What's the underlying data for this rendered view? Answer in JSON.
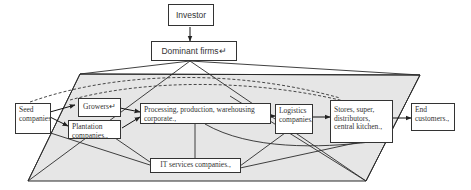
{
  "diagram": {
    "colors": {
      "stroke": "#2b2b2b",
      "plane_fill": "#e6e6e6",
      "box_fill": "#ffffff",
      "text": "#333333"
    },
    "nodes": {
      "investor": "Investor",
      "dominant_firms": "Dominant firms↵",
      "seed_companies": "Seed companies.,",
      "growers": "Growers↵",
      "plantation_companies": "Plantation companies.,",
      "processing": "Processing, production, warehousing corporate.,",
      "logistics": "Logistics companies.,",
      "stores": "Stores, super, distributors, central kitchen.,",
      "end_customers": "End customers.,",
      "it_services": "IT services companies.,"
    },
    "edges": [
      {
        "from": "investor",
        "to": "dominant_firms",
        "style": "arrow"
      },
      {
        "from": "seed_companies",
        "to": "growers",
        "style": "arrow"
      },
      {
        "from": "seed_companies",
        "to": "plantation_companies",
        "style": "arrow"
      },
      {
        "from": "growers",
        "to": "processing",
        "style": "arrow"
      },
      {
        "from": "plantation_companies",
        "to": "processing",
        "style": "arrow"
      },
      {
        "from": "processing",
        "to": "logistics",
        "style": "arrow"
      },
      {
        "from": "logistics",
        "to": "stores",
        "style": "arrow"
      },
      {
        "from": "stores",
        "to": "end_customers",
        "style": "arrow"
      },
      {
        "from": "seed_companies",
        "to": "stores",
        "style": "dashed"
      },
      {
        "from": "growers",
        "to": "stores",
        "style": "dashed"
      },
      {
        "from": "seed_companies",
        "to": "it_services",
        "style": "line"
      },
      {
        "from": "plantation_companies",
        "to": "it_services",
        "style": "line"
      },
      {
        "from": "processing",
        "to": "it_services",
        "style": "line"
      },
      {
        "from": "logistics",
        "to": "it_services",
        "style": "line"
      },
      {
        "from": "stores",
        "to": "it_services",
        "style": "line"
      },
      {
        "from": "processing",
        "to": "stores",
        "style": "curve"
      },
      {
        "from": "dominant_firms",
        "to": "plane",
        "style": "line"
      }
    ]
  }
}
